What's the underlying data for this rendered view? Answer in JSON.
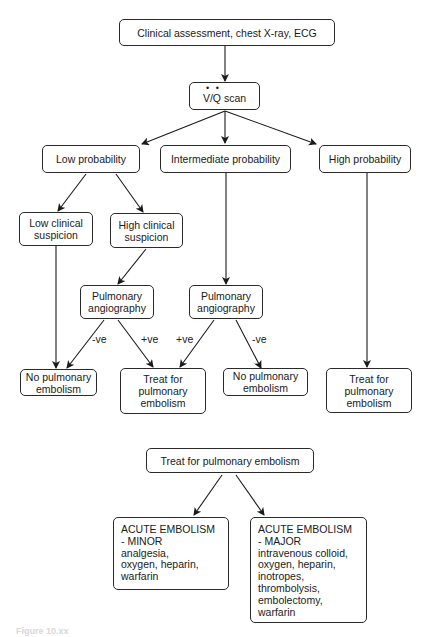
{
  "flowchart": {
    "start": "Clinical assessment, chest X-ray, ECG",
    "vq_scan": {
      "v": "V",
      "slash": "/",
      "q": "Q",
      "rest": " scan"
    },
    "probability": {
      "low": "Low probability",
      "intermediate": "Intermediate probability",
      "high": "High probability"
    },
    "suspicion": {
      "low": [
        "Low clinical",
        "suspicion"
      ],
      "high": [
        "High clinical",
        "suspicion"
      ]
    },
    "angiography_left": [
      "Pulmonary",
      "angiography"
    ],
    "angiography_right": [
      "Pulmonary",
      "angiography"
    ],
    "edge_labels": {
      "left_neg": "-ve",
      "left_pos": "+ve",
      "right_pos": "+ve",
      "right_neg": "-ve"
    },
    "outcomes": {
      "no_pe_left": [
        "No pulmonary",
        "embolism"
      ],
      "treat_center": [
        "Treat for",
        "pulmonary",
        "embolism"
      ],
      "no_pe_right": [
        "No pulmonary",
        "embolism"
      ],
      "treat_right": [
        "Treat for",
        "pulmonary",
        "embolism"
      ]
    }
  },
  "treatment": {
    "root": "Treat for pulmonary embolism",
    "minor": {
      "lines": [
        "ACUTE EMBOLISM",
        "- MINOR",
        "analgesia,",
        "oxygen, heparin,",
        "warfarin"
      ]
    },
    "major": {
      "lines": [
        "ACUTE EMBOLISM",
        "- MAJOR",
        "intravenous colloid,",
        "oxygen, heparin,",
        "inotropes,",
        "thrombolysis,",
        "embolectomy,",
        "warfarin"
      ]
    }
  },
  "caption": "Figure 10.xx"
}
